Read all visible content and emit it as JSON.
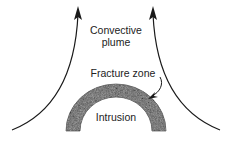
{
  "labels": {
    "plume_line1": "Convective",
    "plume_line2": "plume",
    "fracture_zone": "Fracture zone",
    "intrusion": "Intrusion"
  },
  "colors": {
    "line": "#1a1a1a",
    "intrusion_fill": "#555555",
    "text": "#222222"
  }
}
